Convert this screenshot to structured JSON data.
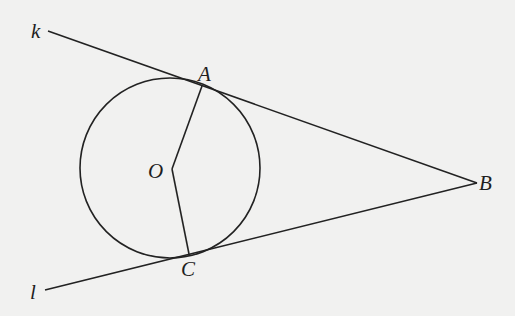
{
  "diagram": {
    "type": "geometry",
    "stroke_color": "#222222",
    "background": "#f1f1f0",
    "circle": {
      "center_label": "O",
      "cx": 170,
      "cy": 168,
      "r": 90
    },
    "points": {
      "A": {
        "label": "A",
        "x": 202,
        "y": 86
      },
      "B": {
        "label": "B",
        "x": 477,
        "y": 183
      },
      "C": {
        "label": "C",
        "x": 189,
        "y": 254
      },
      "O": {
        "label": "O",
        "x": 172,
        "y": 169
      }
    },
    "lines": {
      "k": {
        "label": "k",
        "from": [
          48,
          31
        ],
        "to": [
          477,
          183
        ]
      },
      "l": {
        "label": "l",
        "from": [
          45,
          290
        ],
        "to": [
          477,
          183
        ]
      }
    },
    "segments": [
      {
        "name": "OA",
        "from": "O",
        "to": "A"
      },
      {
        "name": "OC",
        "from": "O",
        "to": "C"
      }
    ]
  }
}
